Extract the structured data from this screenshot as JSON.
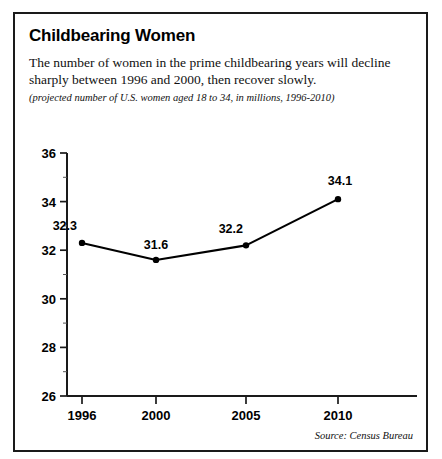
{
  "figure": {
    "title": "Childbearing Women",
    "description": "The number of women in the prime childbearing years will decline sharply between 1996 and 2000, then recover slowly.",
    "subtitle": "(projected number of U.S. women aged 18 to 34, in millions, 1996-2010)",
    "source": "Source: Census Bureau"
  },
  "chart_data": {
    "type": "line",
    "title": "Childbearing Women",
    "subtitle": "(projected number of U.S. women aged 18 to 34, in millions, 1996-2010)",
    "xlabel": "",
    "ylabel": "",
    "categories": [
      "1996",
      "2000",
      "2005",
      "2010"
    ],
    "values": [
      32.3,
      31.6,
      32.2,
      34.1
    ],
    "data_labels": [
      "32.3",
      "31.6",
      "32.2",
      "34.1"
    ],
    "ylim": [
      26,
      36
    ],
    "ytick_labels": [
      "26",
      "28",
      "30",
      "32",
      "34",
      "36"
    ],
    "ytick_values": [
      26,
      28,
      30,
      32,
      34,
      36
    ],
    "yminor_values": [
      27,
      29,
      31,
      33,
      35
    ],
    "xtick_labels": [
      "1996",
      "2000",
      "2005",
      "2010"
    ],
    "grid": false,
    "legend": false,
    "marker": "dot",
    "line_color": "#000000",
    "source": "Source: Census Bureau"
  }
}
